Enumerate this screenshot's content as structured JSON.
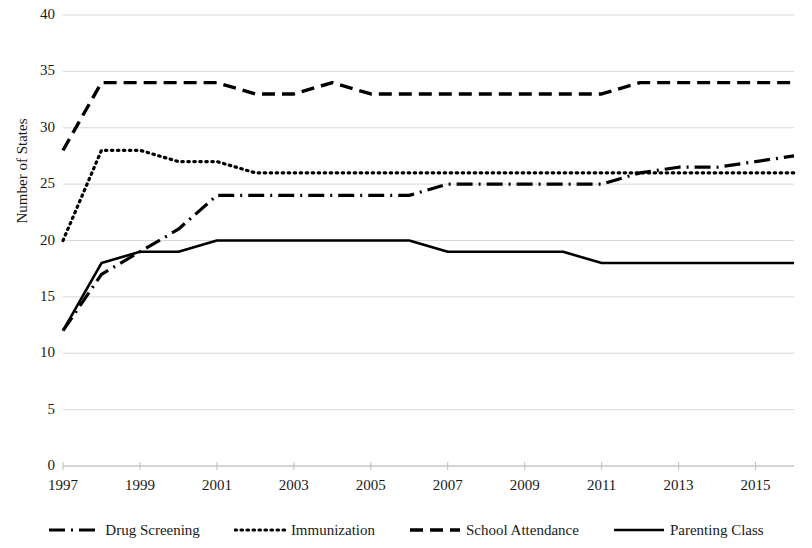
{
  "chart_data": {
    "type": "line",
    "title": "",
    "xlabel": "",
    "ylabel": "Number of States",
    "xlim": [
      1997,
      2016
    ],
    "ylim": [
      0,
      40
    ],
    "y_ticks": [
      40,
      35,
      30,
      25,
      20,
      15,
      10,
      5,
      0
    ],
    "x_ticks": [
      1997,
      1999,
      2001,
      2003,
      2005,
      2007,
      2009,
      2011,
      2013,
      2015
    ],
    "x": [
      1997,
      1998,
      1999,
      2000,
      2001,
      2002,
      2003,
      2004,
      2005,
      2006,
      2007,
      2008,
      2009,
      2010,
      2011,
      2012,
      2013,
      2014,
      2015,
      2016
    ],
    "grid": "horizontal",
    "legend_position": "bottom",
    "series": [
      {
        "name": "Drug Screening",
        "style": "dash-dot",
        "color": "#000000",
        "values": [
          12,
          17,
          19,
          21,
          24,
          24,
          24,
          24,
          24,
          24,
          25,
          25,
          25,
          25,
          25,
          26,
          26.5,
          26.5,
          27,
          27.5
        ]
      },
      {
        "name": "Immunization",
        "style": "dotted",
        "color": "#000000",
        "values": [
          20,
          28,
          28,
          27,
          27,
          26,
          26,
          26,
          26,
          26,
          26,
          26,
          26,
          26,
          26,
          26,
          26,
          26,
          26,
          26
        ]
      },
      {
        "name": "School Attendance",
        "style": "dashed",
        "color": "#000000",
        "values": [
          28,
          34,
          34,
          34,
          34,
          33,
          33,
          34,
          33,
          33,
          33,
          33,
          33,
          33,
          33,
          34,
          34,
          34,
          34,
          34
        ]
      },
      {
        "name": "Parenting Class",
        "style": "solid",
        "color": "#000000",
        "values": [
          12,
          18,
          19,
          19,
          20,
          20,
          20,
          20,
          20,
          20,
          19,
          19,
          19,
          19,
          18,
          18,
          18,
          18,
          18,
          18
        ]
      }
    ]
  },
  "legend": {
    "items": [
      {
        "label": "Drug Screening",
        "style": "dash-dot"
      },
      {
        "label": "Immunization",
        "style": "dotted"
      },
      {
        "label": "School Attendance",
        "style": "dashed"
      },
      {
        "label": "Parenting Class",
        "style": "solid"
      }
    ]
  },
  "axes": {
    "y_title": "Number of States"
  }
}
